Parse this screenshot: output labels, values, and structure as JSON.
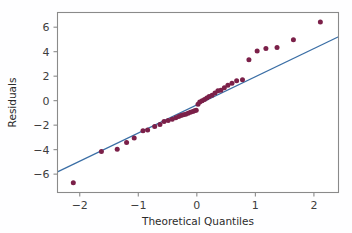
{
  "chart_data": {
    "type": "scatter",
    "title": "",
    "xlabel": "Theoretical Quantiles",
    "ylabel": "Residuals",
    "xlim": [
      -2.38,
      2.42
    ],
    "ylim": [
      -7.5,
      7.2
    ],
    "xticks": [
      -2,
      -1,
      0,
      1,
      2
    ],
    "xtick_labels": [
      "−2",
      "−1",
      "0",
      "1",
      "2"
    ],
    "yticks": [
      6,
      4,
      2,
      0,
      -2,
      -4,
      -6
    ],
    "ytick_labels": [
      "6",
      "4",
      "2",
      "0",
      "−2",
      "−4",
      "−6"
    ],
    "grid": false,
    "legend": "none",
    "marker_color": "#7b2049",
    "line_color": "#3a6ea5",
    "frame_color": "#8a8a8a",
    "background_color": "#ffffff",
    "marker_size": 5.0,
    "series": [
      {
        "name": "Sample Quantiles",
        "kind": "scatter",
        "points": [
          [
            -2.11,
            -6.7
          ],
          [
            -1.63,
            -4.15
          ],
          [
            -1.36,
            -3.97
          ],
          [
            -1.2,
            -3.42
          ],
          [
            -1.07,
            -3.05
          ],
          [
            -0.92,
            -2.45
          ],
          [
            -0.84,
            -2.4
          ],
          [
            -0.72,
            -2.1
          ],
          [
            -0.63,
            -1.95
          ],
          [
            -0.56,
            -1.7
          ],
          [
            -0.49,
            -1.62
          ],
          [
            -0.42,
            -1.52
          ],
          [
            -0.36,
            -1.4
          ],
          [
            -0.31,
            -1.3
          ],
          [
            -0.27,
            -1.22
          ],
          [
            -0.23,
            -1.15
          ],
          [
            -0.19,
            -1.1
          ],
          [
            -0.15,
            -1.02
          ],
          [
            -0.11,
            -0.95
          ],
          [
            -0.07,
            -0.88
          ],
          [
            -0.04,
            -0.82
          ],
          [
            -0.01,
            -0.78
          ],
          [
            0.02,
            -0.3
          ],
          [
            0.05,
            -0.1
          ],
          [
            0.09,
            0.0
          ],
          [
            0.13,
            0.1
          ],
          [
            0.17,
            0.22
          ],
          [
            0.21,
            0.35
          ],
          [
            0.26,
            0.45
          ],
          [
            0.31,
            0.62
          ],
          [
            0.36,
            0.8
          ],
          [
            0.41,
            0.85
          ],
          [
            0.47,
            1.05
          ],
          [
            0.53,
            1.25
          ],
          [
            0.6,
            1.42
          ],
          [
            0.68,
            1.62
          ],
          [
            0.78,
            1.7
          ],
          [
            0.89,
            3.35
          ],
          [
            1.03,
            4.05
          ],
          [
            1.18,
            4.25
          ],
          [
            1.37,
            4.35
          ],
          [
            1.65,
            4.98
          ],
          [
            2.11,
            6.42
          ]
        ]
      },
      {
        "name": "Reference Line",
        "kind": "line",
        "points": [
          [
            -2.38,
            -5.82
          ],
          [
            2.42,
            5.22
          ]
        ]
      }
    ]
  }
}
